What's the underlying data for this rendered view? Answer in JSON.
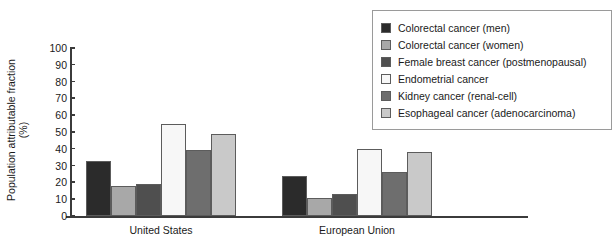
{
  "chart_data": {
    "type": "bar",
    "title": "",
    "subtitle": "",
    "xlabel": "",
    "ylabel": "Population attributable fraction (%)",
    "ylabel_line1": "Population attributable fraction",
    "ylabel_line2": "(%)",
    "ylim": [
      0,
      100
    ],
    "yticks": [
      0,
      10,
      20,
      30,
      40,
      50,
      60,
      70,
      80,
      90,
      100
    ],
    "ytick_labels": [
      "0",
      "10",
      "20",
      "30",
      "40",
      "50",
      "60",
      "70",
      "80",
      "90",
      "100"
    ],
    "grid": false,
    "legend_position": "top-right",
    "categories": [
      "United States",
      "European Union"
    ],
    "series": [
      {
        "name": "Colorectal cancer (men)",
        "color": "#2b2b2b",
        "values": [
          33,
          24
        ]
      },
      {
        "name": "Colorectal cancer (women)",
        "color": "#a8a8a8",
        "values": [
          18,
          11
        ]
      },
      {
        "name": "Female breast cancer (postmenopausal)",
        "color": "#4f4f4f",
        "values": [
          19,
          13
        ]
      },
      {
        "name": "Endometrial cancer",
        "color": "#f7f7f7",
        "values": [
          55,
          40
        ]
      },
      {
        "name": "Kidney cancer (renal-cell)",
        "color": "#6e6e6e",
        "values": [
          39,
          26
        ]
      },
      {
        "name": "Esophageal cancer (adenocarcinoma)",
        "color": "#c9c9c9",
        "values": [
          49,
          38
        ]
      }
    ]
  },
  "legend": {
    "items": [
      {
        "label": "Colorectal cancer (men)",
        "color": "#2b2b2b"
      },
      {
        "label": "Colorectal cancer (women)",
        "color": "#a8a8a8"
      },
      {
        "label": "Female breast cancer (postmenopausal)",
        "color": "#4f4f4f"
      },
      {
        "label": "Endometrial cancer",
        "color": "#f7f7f7"
      },
      {
        "label": "Kidney cancer (renal-cell)",
        "color": "#6e6e6e"
      },
      {
        "label": "Esophageal cancer (adenocarcinoma)",
        "color": "#c9c9c9"
      }
    ]
  },
  "axis": {
    "group_labels": [
      "United States",
      "European Union"
    ]
  },
  "layout": {
    "group_x": [
      16,
      212
    ],
    "bar_width": 25,
    "bar_gap": 0,
    "px_per_unit": 1.68
  }
}
